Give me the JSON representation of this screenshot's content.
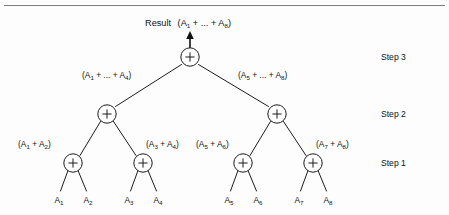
{
  "figure": {
    "type": "binary-reduction-tree",
    "title_label": "Result",
    "result_expression": "(A1 + ... + A8)",
    "operator_symbol": "+",
    "colors": {
      "ink": "#111111",
      "rule": "#7d7d7d",
      "page": "#fdfdfd",
      "node_fill": "#ffffff"
    }
  },
  "result": {
    "word": "Result",
    "open_paren": "(A",
    "sub_first": "1",
    "mid": " + ... + A",
    "sub_last": "8",
    "close_paren": ")"
  },
  "steps": [
    {
      "id": "step-3",
      "label": "Step 3"
    },
    {
      "id": "step-2",
      "label": "Step 2"
    },
    {
      "id": "step-1",
      "label": "Step 1"
    }
  ],
  "step3_nodes": [
    {
      "id": "node-root",
      "op": "+",
      "cx": 190,
      "cy": 57
    }
  ],
  "step2_nodes": [
    {
      "id": "node-l",
      "op": "+",
      "cx": 107,
      "cy": 114
    },
    {
      "id": "node-r",
      "op": "+",
      "cx": 277,
      "cy": 114
    }
  ],
  "step1_nodes": [
    {
      "id": "node-ll",
      "op": "+",
      "cx": 73,
      "cy": 163
    },
    {
      "id": "node-lr",
      "op": "+",
      "cx": 143,
      "cy": 163
    },
    {
      "id": "node-rl",
      "op": "+",
      "cx": 243,
      "cy": 163
    },
    {
      "id": "node-rr",
      "op": "+",
      "cx": 313,
      "cy": 163
    }
  ],
  "step2_labels": [
    {
      "id": "label-left-half",
      "open": "(A",
      "sub_first": "1",
      "mid": " + ... + A",
      "sub_last": "4",
      "close": ")",
      "x": 82,
      "y": 78
    },
    {
      "id": "label-right-half",
      "open": "(A",
      "sub_first": "5",
      "mid": " + ... + A",
      "sub_last": "8",
      "close": ")",
      "x": 238,
      "y": 78
    }
  ],
  "step1_labels": [
    {
      "id": "label-a1-a2",
      "open": "(A",
      "sub_first": "1",
      "mid": " + A",
      "sub_last": "2",
      "close": ")",
      "x": 18,
      "y": 147
    },
    {
      "id": "label-a3-a4",
      "open": "(A",
      "sub_first": "3",
      "mid": " + A",
      "sub_last": "4",
      "close": ")",
      "x": 146,
      "y": 147
    },
    {
      "id": "label-a5-a6",
      "open": "(A",
      "sub_first": "5",
      "mid": " + A",
      "sub_last": "6",
      "close": ")",
      "x": 196,
      "y": 147
    },
    {
      "id": "label-a7-a8",
      "open": "(A",
      "sub_first": "7",
      "mid": " + A",
      "sub_last": "8",
      "close": ")",
      "x": 316,
      "y": 147
    }
  ],
  "leaves": [
    {
      "id": "leaf-a1",
      "base": "A",
      "sub": "1",
      "x": 59,
      "y": 203
    },
    {
      "id": "leaf-a2",
      "base": "A",
      "sub": "2",
      "x": 88,
      "y": 203
    },
    {
      "id": "leaf-a3",
      "base": "A",
      "sub": "3",
      "x": 129,
      "y": 203
    },
    {
      "id": "leaf-a4",
      "base": "A",
      "sub": "4",
      "x": 158,
      "y": 203
    },
    {
      "id": "leaf-a5",
      "base": "A",
      "sub": "5",
      "x": 229,
      "y": 203
    },
    {
      "id": "leaf-a6",
      "base": "A",
      "sub": "6",
      "x": 258,
      "y": 203
    },
    {
      "id": "leaf-a7",
      "base": "A",
      "sub": "7",
      "x": 299,
      "y": 203
    },
    {
      "id": "leaf-a8",
      "base": "A",
      "sub": "8",
      "x": 328,
      "y": 203
    }
  ],
  "step_label_positions": [
    {
      "x": 381,
      "y": 60
    },
    {
      "x": 381,
      "y": 117
    },
    {
      "x": 381,
      "y": 166
    }
  ]
}
